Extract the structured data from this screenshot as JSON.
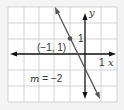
{
  "graph": {
    "grid": {
      "x_min": -5,
      "x_max": 2,
      "y_min": -3,
      "y_max": 3,
      "step": 1
    },
    "axes": {
      "x_label": "x",
      "y_label": "y",
      "x_tick_label": "1",
      "y_tick_label": "1"
    },
    "point": {
      "x": -1,
      "y": 1,
      "label": "(−1, 1)"
    },
    "line": {
      "slope": -2,
      "y_intercept": -1,
      "label": "m = −2",
      "label_var": "m",
      "label_rest": " = −2"
    },
    "colors": {
      "line": "#555555",
      "grid": "#c8c8c8",
      "axis": "#111111",
      "background": "#ffffff"
    }
  }
}
